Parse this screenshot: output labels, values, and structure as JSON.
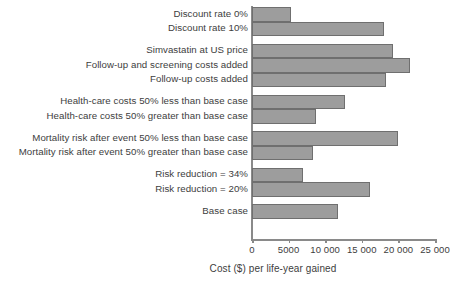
{
  "chart_data": {
    "type": "bar",
    "orientation": "horizontal",
    "title": "",
    "subtitle": "",
    "xlabel": "Cost ($) per life-year gained",
    "ylabel": "",
    "xlim": [
      0,
      25000
    ],
    "grid": false,
    "legend": null,
    "xticks": [
      0,
      5000,
      10000,
      15000,
      20000,
      25000
    ],
    "xticklabels": [
      "0",
      "5000",
      "10 000",
      "15 000",
      "20 000",
      "25 000"
    ],
    "categories": [
      "Discount rate 0%",
      "Discount rate 10%",
      "Simvastatin at US price",
      "Follow-up and screening costs added",
      "Follow-up costs added",
      "Health-care costs 50% less than base case",
      "Health-care costs 50% greater than base case",
      "Mortality risk after event 50% less than base case",
      "Mortality risk after event 50% greater than base case",
      "Risk reduction = 34%",
      "Risk reduction = 20%",
      "Base case"
    ],
    "values": [
      5300,
      18000,
      19300,
      21600,
      18300,
      12700,
      8700,
      20000,
      8300,
      6900,
      16100,
      11700
    ],
    "groups": [
      {
        "name": "discount-rate",
        "indices": [
          0,
          1
        ]
      },
      {
        "name": "cost-assumptions",
        "indices": [
          2,
          3,
          4
        ]
      },
      {
        "name": "health-care-costs",
        "indices": [
          5,
          6
        ]
      },
      {
        "name": "mortality-risk",
        "indices": [
          7,
          8
        ]
      },
      {
        "name": "risk-reduction",
        "indices": [
          9,
          10
        ]
      },
      {
        "name": "base-case",
        "indices": [
          11
        ]
      }
    ],
    "colors": {
      "bar_fill": "#9d9d9d",
      "bar_stroke": "#6f6f6f",
      "axis": "#8a8a8a",
      "text": "#3d3d3d",
      "background": "#ffffff"
    }
  }
}
